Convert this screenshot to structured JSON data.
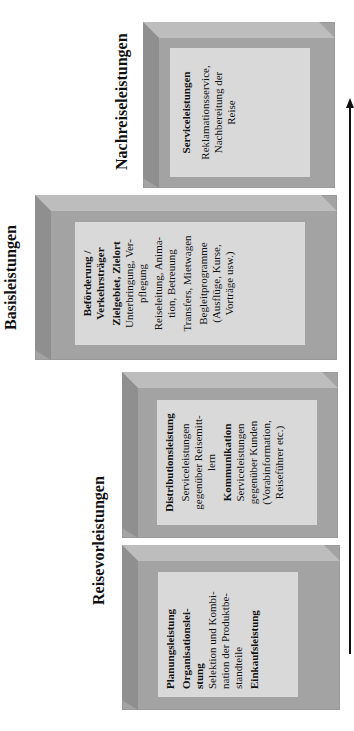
{
  "headings": {
    "nachreise": "Nachreiseleistungen",
    "basis": "Basisleistungen",
    "vorreise": "Reisevorleistungen"
  },
  "boxes": {
    "nachreise": {
      "lines": [
        {
          "text": "Serviceleistungen",
          "bold": true
        },
        {
          "text": "Reklamationsservice,",
          "bold": false
        },
        {
          "text": "Nachbereitung der",
          "bold": false
        },
        {
          "text": "Reise",
          "bold": false
        }
      ]
    },
    "basis": {
      "lines": [
        {
          "text": "Beförderung /",
          "bold": true
        },
        {
          "text": "Verkehrsträger",
          "bold": true
        },
        {
          "text": "Zielgebiet, Zielort",
          "bold": true
        },
        {
          "text": "Unterbringung, Ver-",
          "bold": false
        },
        {
          "text": "pflegung",
          "bold": false
        },
        {
          "text": "Reiseleitung, Anima-",
          "bold": false
        },
        {
          "text": "tion, Betreuung",
          "bold": false
        },
        {
          "text": "Transfers, Mietwagen",
          "bold": false
        },
        {
          "text": "Begleitprogramme",
          "bold": false
        },
        {
          "text": "(Ausflüge, Kurse,",
          "bold": false
        },
        {
          "text": "Vorträge usw.)",
          "bold": false
        }
      ]
    },
    "distribution": {
      "lines": [
        {
          "text": "Distributionsleistung",
          "bold": true
        },
        {
          "text": "Serviceleistungen",
          "bold": false
        },
        {
          "text": "gegenüber Reisemitt-",
          "bold": false
        },
        {
          "text": "lern",
          "bold": false
        },
        {
          "text": "Kommunikation",
          "bold": true
        },
        {
          "text": "Serviceleistungen",
          "bold": false
        },
        {
          "text": "gegenüber Kunden",
          "bold": false
        },
        {
          "text": "(Vorabinformation,",
          "bold": false
        },
        {
          "text": "Reiseführer etc.)",
          "bold": false
        }
      ]
    },
    "planung": {
      "lines": [
        {
          "text": "Planungsleistung",
          "bold": true
        },
        {
          "text": "Organisationslei-",
          "bold": true
        },
        {
          "text": "stung",
          "bold": true
        },
        {
          "text": "Selektion und Kombi-",
          "bold": false
        },
        {
          "text": "nation der Produktbe-",
          "bold": false
        },
        {
          "text": "standteile",
          "bold": false
        },
        {
          "text": "Einkaufsleistung",
          "bold": true
        }
      ]
    }
  },
  "arrow": {
    "direction": "up",
    "meaning": "time-sequence"
  }
}
